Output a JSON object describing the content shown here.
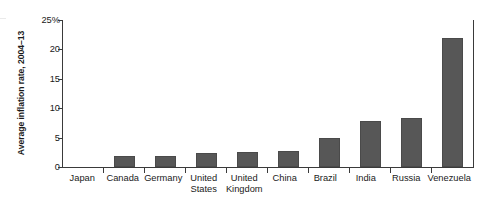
{
  "chart_data": {
    "type": "bar",
    "title": "",
    "xlabel": "",
    "ylabel": "Average inflation rate, 2004–13",
    "categories": [
      "Japan",
      "Canada",
      "Germany",
      "United\nStates",
      "United\nKingdom",
      "China",
      "Brazil",
      "India",
      "Russia",
      "Venezuela"
    ],
    "values": [
      0,
      1.8,
      1.8,
      2.3,
      2.6,
      2.7,
      5.0,
      7.9,
      8.4,
      21.9
    ],
    "ylim": [
      0,
      25
    ],
    "yticks": [
      0,
      5,
      10,
      15,
      20,
      25
    ],
    "ytick_labels": [
      "0",
      "5",
      "10",
      "15",
      "20",
      "25%"
    ],
    "grid": false,
    "legend": false,
    "bar_color": "#575757",
    "axis_color": "#3a3a3a"
  }
}
